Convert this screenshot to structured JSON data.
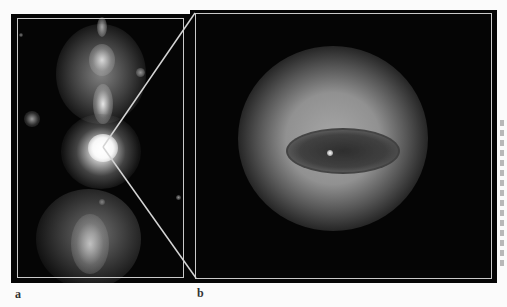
{
  "figure": {
    "panels": [
      {
        "id": "a",
        "label": "a",
        "description": "Wide-field image of a galaxy with bipolar jets/lobes extending north and south of a bright nucleus"
      },
      {
        "id": "b",
        "label": "b",
        "description": "Zoomed view of the nucleus showing a dark elliptical dust disk/ring with a bright central point source surrounded by a diffuse glow"
      }
    ],
    "zoom_connector": {
      "from_panel": "a",
      "to_panel": "b",
      "origin_point": [
        103,
        147
      ]
    },
    "colors": {
      "page_background": "#fbfbfb",
      "image_background": "#050505",
      "frame": "#c9c9c9",
      "label_text": "#333333"
    }
  }
}
